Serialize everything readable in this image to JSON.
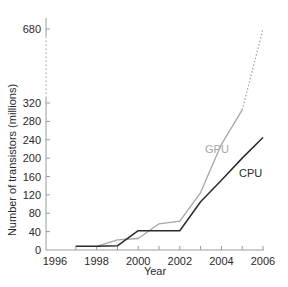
{
  "chart_data": {
    "type": "line",
    "title": "",
    "xlabel": "Year",
    "ylabel": "Number of transistors (millions)",
    "x_ticks": [
      1996,
      1998,
      2000,
      2002,
      2004,
      2006
    ],
    "y_ticks": [
      0,
      40,
      80,
      120,
      160,
      200,
      240,
      280,
      320,
      680
    ],
    "xlim": [
      1996,
      2006
    ],
    "ylim": [
      0,
      680
    ],
    "y_axis_break": {
      "from": 320,
      "to": 680,
      "style": "dotted"
    },
    "grid": false,
    "legend": "inline labels",
    "series": [
      {
        "name": "GPU",
        "color": "#a6a6a6",
        "x": [
          1998,
          1999,
          2000,
          2001,
          2002,
          2003,
          2004,
          2005,
          2006
        ],
        "values": [
          8,
          22,
          25,
          57,
          63,
          125,
          230,
          305,
          680
        ],
        "dotted_last_segment": true
      },
      {
        "name": "CPU",
        "color": "#2b2b2b",
        "x": [
          1997,
          1998,
          1999,
          2000,
          2001,
          2002,
          2003,
          2004,
          2005,
          2006
        ],
        "values": [
          8,
          8,
          9,
          42,
          42,
          42,
          105,
          152,
          200,
          245
        ]
      }
    ]
  },
  "labels": {
    "xlabel": "Year",
    "ylabel": "Number of transistors (millions)",
    "gpu": "GPU",
    "cpu": "CPU"
  }
}
